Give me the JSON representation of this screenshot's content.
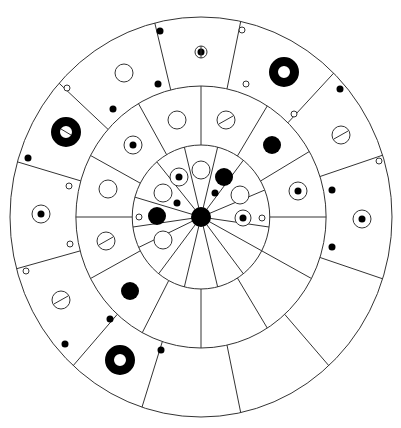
{
  "diagram": {
    "type": "concentric-ring-wheel",
    "center": [
      201,
      217
    ],
    "scale": [
      0.955,
      1.0
    ],
    "rings": [
      {
        "name": "inner",
        "radius": 72
      },
      {
        "name": "middle",
        "radius": 131
      },
      {
        "name": "outer",
        "radius": 200
      }
    ],
    "hub": {
      "radius": 10,
      "color": "#000000"
    },
    "stroke_color": "#333333",
    "inner_spokes_deg": [
      -104,
      -76,
      -52,
      -22,
      8,
      28,
      52,
      76,
      104,
      128,
      155,
      172,
      196,
      230
    ],
    "middle_dividers_deg": [
      -90,
      -58,
      -30,
      0,
      28,
      58,
      90,
      118,
      152,
      180,
      208,
      240
    ],
    "outer_dividers_deg": [
      -104,
      -78,
      -46,
      -18,
      18,
      48,
      78,
      108,
      132,
      165,
      196,
      222
    ],
    "marks": [
      {
        "kind": "dot",
        "x": 160,
        "y": 31,
        "r": 3.5
      },
      {
        "kind": "ring-dot",
        "x": 201,
        "y": 52,
        "r": 6,
        "inner": 3.5
      },
      {
        "kind": "open",
        "x": 242,
        "y": 30,
        "r": 3
      },
      {
        "kind": "dot",
        "x": 158,
        "y": 84,
        "r": 3.5
      },
      {
        "kind": "open",
        "x": 246,
        "y": 84,
        "r": 3
      },
      {
        "kind": "open",
        "x": 124,
        "y": 73,
        "r": 9
      },
      {
        "kind": "thick-ring",
        "x": 284,
        "y": 72,
        "r": 15,
        "w": 9
      },
      {
        "kind": "dot",
        "x": 340,
        "y": 89,
        "r": 3.5
      },
      {
        "kind": "open",
        "x": 294,
        "y": 114,
        "r": 3
      },
      {
        "kind": "open",
        "x": 67,
        "y": 88,
        "r": 3
      },
      {
        "kind": "dot",
        "x": 113,
        "y": 109,
        "r": 3.5
      },
      {
        "kind": "thick-ring-slot",
        "x": 66,
        "y": 132,
        "r": 15,
        "w": 9,
        "slot": true
      },
      {
        "kind": "slot",
        "x": 341,
        "y": 135,
        "r": 9
      },
      {
        "kind": "open",
        "x": 379,
        "y": 161,
        "r": 3
      },
      {
        "kind": "dot",
        "x": 28,
        "y": 158,
        "r": 3.5
      },
      {
        "kind": "open",
        "x": 69,
        "y": 186,
        "r": 3
      },
      {
        "kind": "ring-dot",
        "x": 41,
        "y": 214,
        "r": 9,
        "inner": 3.5
      },
      {
        "kind": "open",
        "x": 70,
        "y": 244,
        "r": 3
      },
      {
        "kind": "dot",
        "x": 332,
        "y": 190,
        "r": 3.5
      },
      {
        "kind": "ring-dot",
        "x": 362,
        "y": 219,
        "r": 9,
        "inner": 3.5
      },
      {
        "kind": "dot",
        "x": 332,
        "y": 247,
        "r": 3.5
      },
      {
        "kind": "open",
        "x": 26,
        "y": 271,
        "r": 3
      },
      {
        "kind": "slot",
        "x": 61,
        "y": 300,
        "r": 9
      },
      {
        "kind": "dot",
        "x": 65,
        "y": 344,
        "r": 3.5
      },
      {
        "kind": "dot",
        "x": 110,
        "y": 319,
        "r": 3.5
      },
      {
        "kind": "thick-ring",
        "x": 120,
        "y": 360,
        "r": 15,
        "w": 9
      },
      {
        "kind": "dot",
        "x": 161,
        "y": 350,
        "r": 3.5
      },
      {
        "kind": "open",
        "x": 177,
        "y": 120,
        "r": 9
      },
      {
        "kind": "slot",
        "x": 226,
        "y": 120,
        "r": 9
      },
      {
        "kind": "ring-dot",
        "x": 133,
        "y": 145,
        "r": 9,
        "inner": 3.5
      },
      {
        "kind": "dot",
        "x": 272,
        "y": 145,
        "r": 9
      },
      {
        "kind": "open",
        "x": 108,
        "y": 189,
        "r": 9
      },
      {
        "kind": "ring-dot",
        "x": 298,
        "y": 191,
        "r": 9,
        "inner": 3.5
      },
      {
        "kind": "slot",
        "x": 106,
        "y": 241,
        "r": 9
      },
      {
        "kind": "dot",
        "x": 130,
        "y": 291,
        "r": 9
      },
      {
        "kind": "open",
        "x": 201,
        "y": 170,
        "r": 9
      },
      {
        "kind": "ring-dot",
        "x": 179,
        "y": 177,
        "r": 9,
        "inner": 3.5
      },
      {
        "kind": "dot",
        "x": 224,
        "y": 177,
        "r": 9
      },
      {
        "kind": "open",
        "x": 163,
        "y": 193,
        "r": 9
      },
      {
        "kind": "dot",
        "x": 177,
        "y": 203,
        "r": 3.5
      },
      {
        "kind": "dot",
        "x": 215,
        "y": 193,
        "r": 3.5
      },
      {
        "kind": "open",
        "x": 240,
        "y": 195,
        "r": 9
      },
      {
        "kind": "dot",
        "x": 157,
        "y": 216,
        "r": 9
      },
      {
        "kind": "open",
        "x": 139,
        "y": 217,
        "r": 3
      },
      {
        "kind": "ring-dot",
        "x": 243,
        "y": 218,
        "r": 8,
        "inner": 3.5
      },
      {
        "kind": "open",
        "x": 262,
        "y": 218,
        "r": 3
      },
      {
        "kind": "open",
        "x": 163,
        "y": 240,
        "r": 9
      }
    ]
  }
}
